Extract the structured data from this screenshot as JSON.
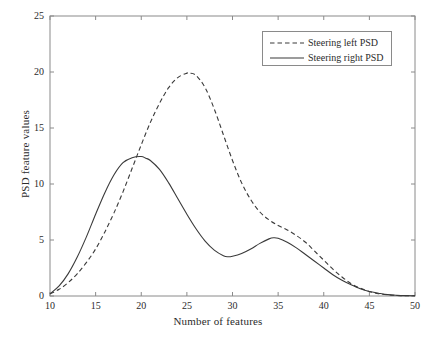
{
  "chart_data": {
    "type": "line",
    "title": "",
    "xlabel": "Number of features",
    "ylabel": "PSD feature values",
    "xlim": [
      10,
      50
    ],
    "ylim": [
      0,
      25
    ],
    "xticks": [
      10,
      15,
      20,
      25,
      30,
      35,
      40,
      45,
      50
    ],
    "yticks": [
      0,
      5,
      10,
      15,
      20,
      25
    ],
    "xtick_labels": [
      "10",
      "15",
      "20",
      "25",
      "30",
      "35",
      "40",
      "45",
      "50"
    ],
    "ytick_labels": [
      "0",
      "5",
      "10",
      "15",
      "20",
      "25"
    ],
    "grid": false,
    "legend_position": "upper right",
    "series": [
      {
        "name": "Steering left PSD",
        "style": "dashed",
        "color": "#3a3a3a",
        "x": [
          10,
          11,
          12,
          13,
          14,
          15,
          16,
          17,
          18,
          19,
          20,
          21,
          22,
          23,
          24,
          25,
          25.3,
          26,
          27,
          28,
          29,
          30,
          31,
          32,
          33,
          34,
          35,
          36,
          37,
          38,
          39,
          40,
          41,
          42,
          43,
          44,
          45,
          46,
          47,
          48,
          49,
          50
        ],
        "y": [
          0.2,
          0.6,
          1.2,
          2.0,
          3.0,
          4.2,
          5.7,
          7.4,
          9.3,
          11.4,
          13.5,
          15.5,
          17.2,
          18.6,
          19.5,
          19.9,
          19.9,
          19.7,
          18.6,
          16.7,
          14.4,
          12.1,
          10.1,
          8.6,
          7.5,
          6.8,
          6.3,
          5.9,
          5.4,
          4.8,
          4.0,
          3.2,
          2.4,
          1.7,
          1.1,
          0.7,
          0.4,
          0.2,
          0.1,
          0.05,
          0.03,
          0.02
        ]
      },
      {
        "name": "Steering right PSD",
        "style": "solid",
        "color": "#3a3a3a",
        "x": [
          10,
          11,
          12,
          13,
          14,
          15,
          16,
          17,
          18,
          19,
          20,
          20.5,
          21,
          22,
          23,
          24,
          25,
          26,
          27,
          28,
          29,
          29.5,
          30,
          31,
          32,
          33,
          34,
          34.5,
          35,
          36,
          37,
          38,
          39,
          40,
          41,
          42,
          43,
          44,
          45,
          46,
          47,
          48,
          49,
          50
        ],
        "y": [
          0.2,
          0.9,
          2.0,
          3.5,
          5.3,
          7.3,
          9.2,
          10.8,
          11.9,
          12.35,
          12.45,
          12.3,
          12.1,
          11.3,
          10.1,
          8.7,
          7.3,
          6.0,
          4.9,
          4.1,
          3.6,
          3.5,
          3.55,
          3.8,
          4.2,
          4.7,
          5.1,
          5.2,
          5.15,
          4.8,
          4.3,
          3.7,
          3.1,
          2.5,
          1.9,
          1.4,
          1.0,
          0.65,
          0.4,
          0.25,
          0.12,
          0.06,
          0.03,
          0.02
        ]
      }
    ]
  },
  "legend": {
    "entries": [
      {
        "label": "Steering left PSD",
        "style": "dashed"
      },
      {
        "label": "Steering right PSD",
        "style": "solid"
      }
    ]
  },
  "style": {
    "axis_color": "#8a8a8a",
    "line_color": "#3a3a3a",
    "text_color": "#2b2b2b",
    "background": "#ffffff"
  }
}
